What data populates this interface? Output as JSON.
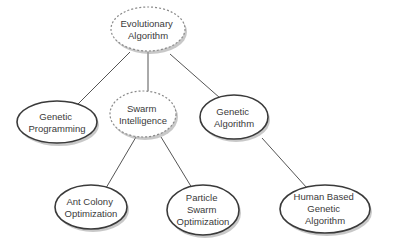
{
  "diagram": {
    "type": "tree",
    "nodes": [
      {
        "id": "ea",
        "lines": [
          "Evolutionary",
          "Algorithm"
        ],
        "style": "dashed"
      },
      {
        "id": "gp",
        "lines": [
          "Genetic",
          "Programming"
        ],
        "style": "solid"
      },
      {
        "id": "si",
        "lines": [
          "Swarm",
          "Intelligence"
        ],
        "style": "dashed"
      },
      {
        "id": "ga",
        "lines": [
          "Genetic",
          "Algorithm"
        ],
        "style": "solid"
      },
      {
        "id": "aco",
        "lines": [
          "Ant Colony",
          "Optimization"
        ],
        "style": "solid"
      },
      {
        "id": "pso",
        "lines": [
          "Particle",
          "Swarm",
          "Optimization"
        ],
        "style": "solid"
      },
      {
        "id": "hbga",
        "lines": [
          "Human Based",
          "Genetic",
          "Algorithm"
        ],
        "style": "solid"
      }
    ],
    "edges": [
      {
        "from": "ea",
        "to": "gp"
      },
      {
        "from": "ea",
        "to": "si"
      },
      {
        "from": "ea",
        "to": "ga"
      },
      {
        "from": "si",
        "to": "aco"
      },
      {
        "from": "si",
        "to": "pso"
      },
      {
        "from": "ga",
        "to": "hbga"
      }
    ]
  }
}
